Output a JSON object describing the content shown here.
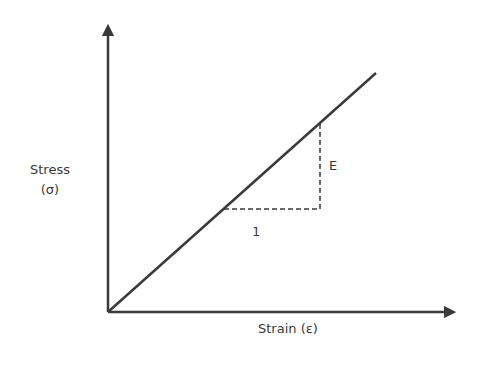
{
  "diagram": {
    "y_axis": {
      "label_line1": "Stress",
      "label_line2": "(σ)"
    },
    "x_axis": {
      "label": "Strain (ε)"
    },
    "slope_triangle": {
      "run_label": "1",
      "rise_label": "E"
    },
    "colors": {
      "line": "#3a3a3a",
      "background": "#ffffff"
    }
  }
}
